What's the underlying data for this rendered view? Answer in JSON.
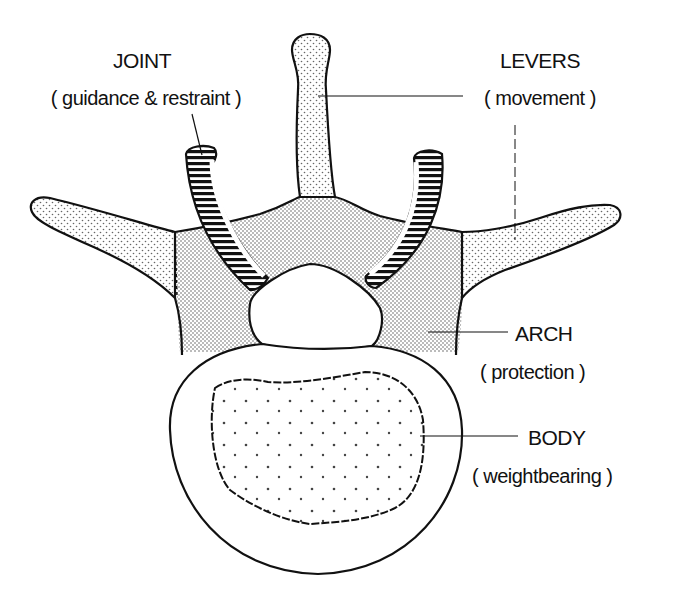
{
  "diagram": {
    "colors": {
      "outline": "#111111",
      "stipple_fill": "#f3f3f3",
      "stipple_dot": "#555555",
      "background": "#ffffff"
    },
    "labels": [
      {
        "id": "joint",
        "title": "JOINT",
        "subtitle": "( guidance & restraint )",
        "points_to": "facet joint (hatched)"
      },
      {
        "id": "levers",
        "title": "LEVERS",
        "subtitle": "( movement )",
        "points_to": "spinous and transverse processes"
      },
      {
        "id": "arch",
        "title": "ARCH",
        "subtitle": "( protection )",
        "points_to": "vertebral arch / lamina"
      },
      {
        "id": "body",
        "title": "BODY",
        "subtitle": "( weightbearing )",
        "points_to": "vertebral body (cancellous center)"
      }
    ]
  }
}
